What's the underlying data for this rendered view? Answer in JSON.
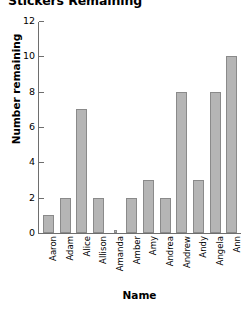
{
  "chart_data": {
    "type": "bar",
    "title": "Stickers Remaining",
    "xlabel": "Name",
    "ylabel": "Number remaining",
    "categories": [
      "Aaron",
      "Adam",
      "Alice",
      "Allison",
      "Amanda",
      "Amber",
      "Amy",
      "Andrea",
      "Andrew",
      "Andy",
      "Angela",
      "Ann"
    ],
    "values": [
      1,
      2,
      7,
      2,
      0,
      2,
      3,
      2,
      8,
      3,
      8,
      10
    ],
    "ylim": [
      0,
      12
    ],
    "yticks": [
      0,
      2,
      4,
      6,
      8,
      10,
      12
    ],
    "ytick_labels": [
      "0",
      "2",
      "4",
      "6",
      "8",
      "10",
      "12"
    ],
    "grid": false,
    "legend": false,
    "bar_color": "#b5b5b5",
    "bar_border_color": "#8a8a8a",
    "axis_color": "#6e6e6e",
    "text_color": "#000000",
    "background": "#ffffff"
  }
}
